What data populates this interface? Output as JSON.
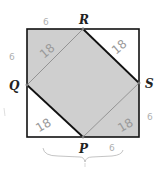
{
  "diagram": {
    "points": {
      "P": {
        "label": "P"
      },
      "Q": {
        "label": "Q"
      },
      "R": {
        "label": "R"
      },
      "S": {
        "label": "S"
      }
    },
    "triangle_labels": {
      "top_left": "18",
      "top_right": "18",
      "bottom_left": "18",
      "bottom_right": "18"
    },
    "side_marks": {
      "top": "6",
      "left": "6",
      "right": "6",
      "bottom": "6"
    },
    "colors": {
      "shade": "#cfcfcf",
      "outline": "#111111",
      "thin_edge": "#8a8a8a",
      "handwriting": "#9a9a9a"
    }
  }
}
